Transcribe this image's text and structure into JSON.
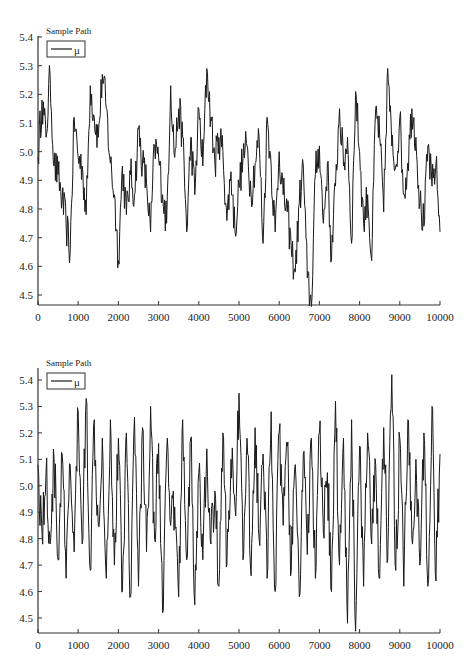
{
  "chart_data": [
    {
      "type": "line",
      "title": "Sample Path",
      "legend": [
        "μ"
      ],
      "legend_position": "upper-left",
      "xlabel": "",
      "ylabel": "",
      "xlim": [
        0,
        10000
      ],
      "ylim": [
        4.45,
        5.4
      ],
      "grid": false,
      "xticks": [
        "0",
        "1000",
        "2000",
        "3000",
        "4000",
        "5000",
        "6000",
        "7000",
        "8000",
        "9000",
        "10000"
      ],
      "yticks": [
        "4.5",
        "4.6",
        "4.7",
        "4.8",
        "4.9",
        "5.0",
        "5.1",
        "5.2",
        "5.3",
        "5.4"
      ],
      "description": "Trace plot of MCMC sample path for mu with strong autocorrelation (slow wandering around 4.95), range approx 4.46–5.39",
      "series": [
        {
          "name": "μ",
          "x": [
            0,
            100,
            200,
            300,
            400,
            500,
            600,
            700,
            800,
            900,
            1000,
            1100,
            1200,
            1300,
            1400,
            1500,
            1600,
            1700,
            1800,
            1900,
            2000,
            2100,
            2200,
            2300,
            2400,
            2500,
            2600,
            2700,
            2800,
            2900,
            3000,
            3100,
            3200,
            3300,
            3400,
            3500,
            3600,
            3700,
            3800,
            3900,
            4000,
            4100,
            4200,
            4300,
            4400,
            4500,
            4600,
            4700,
            4800,
            4900,
            5000,
            5100,
            5200,
            5300,
            5400,
            5500,
            5600,
            5700,
            5800,
            5900,
            6000,
            6100,
            6200,
            6300,
            6400,
            6500,
            6600,
            6700,
            6800,
            6900,
            7000,
            7100,
            7200,
            7300,
            7400,
            7500,
            7600,
            7700,
            7800,
            7900,
            8000,
            8100,
            8200,
            8300,
            8400,
            8500,
            8600,
            8700,
            8800,
            8900,
            9000,
            9100,
            9200,
            9300,
            9400,
            9500,
            9600,
            9700,
            9800,
            9900,
            10000
          ],
          "values": [
            4.98,
            5.18,
            5.05,
            5.27,
            4.95,
            4.92,
            4.83,
            4.75,
            4.65,
            5.12,
            4.98,
            4.95,
            4.78,
            5.23,
            5.12,
            5.05,
            5.27,
            5.15,
            4.96,
            4.85,
            4.62,
            4.95,
            4.78,
            4.92,
            4.85,
            5.08,
            4.96,
            4.89,
            4.72,
            5.02,
            4.98,
            4.85,
            4.75,
            5.23,
            4.98,
            5.15,
            5.05,
            4.72,
            5.05,
            4.85,
            5.15,
            4.95,
            5.29,
            5.12,
            4.96,
            5.05,
            5.0,
            4.76,
            4.93,
            4.72,
            4.88,
            4.98,
            5.02,
            4.85,
            4.96,
            5.05,
            4.68,
            5.12,
            4.95,
            4.72,
            5.0,
            4.85,
            4.79,
            4.66,
            4.58,
            4.82,
            4.95,
            4.56,
            4.46,
            4.92,
            5.02,
            4.75,
            4.96,
            4.62,
            4.88,
            5.15,
            4.95,
            5.05,
            4.68,
            5.21,
            5.0,
            4.75,
            4.85,
            4.62,
            5.15,
            5.05,
            4.79,
            5.29,
            5.02,
            4.95,
            5.12,
            4.85,
            4.96,
            5.15,
            5.05,
            4.82,
            4.74,
            5.02,
            4.88,
            4.96,
            4.72
          ]
        }
      ]
    },
    {
      "type": "line",
      "title": "Sample Path",
      "legend": [
        "μ"
      ],
      "legend_position": "upper-left",
      "xlabel": "",
      "ylabel": "",
      "xlim": [
        0,
        10000
      ],
      "ylim": [
        4.45,
        5.43
      ],
      "grid": false,
      "xticks": [
        "0",
        "1000",
        "2000",
        "3000",
        "4000",
        "5000",
        "6000",
        "7000",
        "8000",
        "9000",
        "10000"
      ],
      "yticks": [
        "4.5",
        "4.6",
        "4.7",
        "4.8",
        "4.9",
        "5.0",
        "5.1",
        "5.2",
        "5.3",
        "5.4"
      ],
      "description": "Trace plot of MCMC sample path for mu with rapid mixing (white-noise-like oscillation around 4.95), range approx 4.45–5.42",
      "series": [
        {
          "name": "μ",
          "x": [
            0,
            100,
            200,
            300,
            400,
            500,
            600,
            700,
            800,
            900,
            1000,
            1100,
            1200,
            1300,
            1400,
            1500,
            1600,
            1700,
            1800,
            1900,
            2000,
            2100,
            2200,
            2300,
            2400,
            2500,
            2600,
            2700,
            2800,
            2900,
            3000,
            3100,
            3200,
            3300,
            3400,
            3500,
            3600,
            3700,
            3800,
            3900,
            4000,
            4100,
            4200,
            4300,
            4400,
            4500,
            4600,
            4700,
            4800,
            4900,
            5000,
            5100,
            5200,
            5300,
            5400,
            5500,
            5600,
            5700,
            5800,
            5900,
            6000,
            6100,
            6200,
            6300,
            6400,
            6500,
            6600,
            6700,
            6800,
            6900,
            7000,
            7100,
            7200,
            7300,
            7400,
            7500,
            7600,
            7700,
            7800,
            7900,
            8000,
            8100,
            8200,
            8300,
            8400,
            8500,
            8600,
            8700,
            8800,
            8900,
            9000,
            9100,
            9200,
            9300,
            9400,
            9500,
            9600,
            9700,
            9800,
            9900,
            10000
          ],
          "values": [
            5.08,
            4.82,
            5.05,
            4.78,
            5.1,
            4.72,
            5.12,
            4.65,
            5.08,
            4.75,
            5.28,
            4.78,
            5.33,
            4.68,
            5.25,
            4.85,
            5.18,
            4.65,
            5.25,
            4.7,
            5.18,
            4.6,
            5.2,
            4.58,
            5.26,
            4.62,
            5.22,
            4.75,
            5.3,
            4.8,
            5.16,
            4.52,
            5.12,
            4.85,
            4.92,
            4.58,
            5.25,
            4.72,
            5.18,
            4.55,
            5.05,
            4.72,
            5.14,
            4.78,
            4.98,
            4.62,
            5.2,
            4.7,
            5.1,
            4.92,
            5.35,
            4.72,
            5.18,
            4.66,
            5.22,
            4.8,
            5.12,
            4.65,
            5.28,
            4.6,
            5.2,
            4.85,
            5.15,
            4.68,
            5.08,
            4.58,
            5.12,
            4.74,
            5.18,
            4.65,
            5.2,
            4.82,
            5.05,
            4.6,
            5.32,
            4.7,
            5.18,
            4.48,
            5.25,
            4.45,
            5.15,
            4.62,
            5.2,
            4.78,
            5.08,
            4.65,
            5.22,
            4.72,
            5.42,
            4.68,
            5.18,
            4.62,
            5.25,
            4.8,
            5.1,
            4.7,
            5.2,
            4.62,
            5.3,
            4.64,
            5.12
          ]
        }
      ]
    }
  ],
  "charts": {
    "top": {
      "title": "Sample Path",
      "legend_label": "μ"
    },
    "bottom": {
      "title": "Sample Path",
      "legend_label": "μ"
    }
  },
  "colors": {
    "line": "#1a1a1a",
    "axis": "#333333",
    "background": "#ffffff"
  }
}
